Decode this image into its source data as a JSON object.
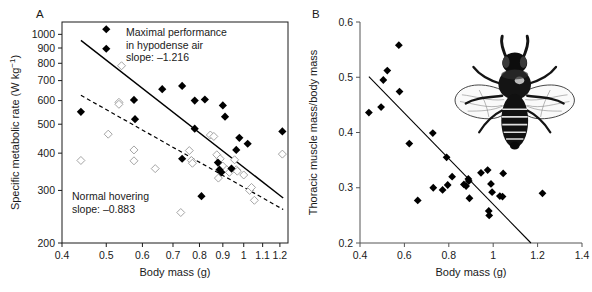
{
  "figure": {
    "panels": [
      {
        "label": "A",
        "xlabel": "Body mass (g)",
        "ylabel": "Specific metabolic rate (W kg⁻¹)",
        "annotation_top": [
          "Maximal performance",
          "in hypodense air",
          "slope: –1.216"
        ],
        "annotation_bottom": [
          "Normal hovering",
          "slope: –0.883"
        ]
      },
      {
        "label": "B",
        "xlabel": "Body mass (g)",
        "ylabel": "Thoracic muscle mass/body mass",
        "illustration": "bee-illustration"
      }
    ]
  },
  "chart_data": [
    {
      "type": "scatter",
      "panel": "A",
      "title": "",
      "xlabel": "Body mass (g)",
      "ylabel": "Specific metabolic rate (W kg-1)",
      "xscale": "log",
      "yscale": "log",
      "xlim": [
        0.4,
        1.25
      ],
      "ylim": [
        200,
        1100
      ],
      "xticks": [
        0.4,
        0.5,
        0.6,
        0.7,
        0.8,
        0.9,
        1,
        1.1,
        1.2
      ],
      "xticklabels": [
        "0.4",
        "0.5",
        "0.6",
        "0.7",
        "0.8",
        "0.9",
        "1",
        "1.1",
        "1.2"
      ],
      "yticks": [
        200,
        300,
        400,
        500,
        600,
        700,
        800,
        900,
        1000
      ],
      "yticklabels": [
        "200",
        "300",
        "400",
        "500",
        "600",
        "700",
        "800",
        "900",
        "1000"
      ],
      "grid": false,
      "legend": "none",
      "frame": "box",
      "annotations": [
        {
          "text": "Maximal performance in hypodense air slope: -1.216",
          "x": 0.72,
          "y": 980
        },
        {
          "text": "Normal hovering slope: -0.883",
          "x": 0.47,
          "y": 300
        }
      ],
      "series": [
        {
          "name": "Maximal performance in hypodense air",
          "marker": "filled-diamond",
          "slope": -1.216,
          "fit_line": {
            "x": [
              0.44,
              1.22
            ],
            "y": [
              955,
              283
            ]
          },
          "points": [
            [
              0.44,
              550
            ],
            [
              0.5,
              1040
            ],
            [
              0.5,
              895
            ],
            [
              0.575,
              603
            ],
            [
              0.578,
              520
            ],
            [
              0.663,
              655
            ],
            [
              0.733,
              672
            ],
            [
              0.733,
              383
            ],
            [
              0.781,
              600
            ],
            [
              0.781,
              483
            ],
            [
              0.808,
              287
            ],
            [
              0.822,
              605
            ],
            [
              0.878,
              372
            ],
            [
              0.885,
              352
            ],
            [
              0.893,
              345
            ],
            [
              0.9,
              578
            ],
            [
              0.91,
              530
            ],
            [
              0.94,
              355
            ],
            [
              0.963,
              410
            ],
            [
              0.978,
              450
            ],
            [
              1.02,
              430
            ],
            [
              1.215,
              473
            ]
          ]
        },
        {
          "name": "Normal hovering",
          "marker": "open-diamond",
          "slope": -0.883,
          "fit_line": {
            "x": [
              0.44,
              1.22
            ],
            "y": [
              625,
              259
            ]
          },
          "points": [
            [
              0.44,
              378
            ],
            [
              0.505,
              463
            ],
            [
              0.533,
              592
            ],
            [
              0.533,
              583
            ],
            [
              0.54,
              785
            ],
            [
              0.575,
              410
            ],
            [
              0.575,
              377
            ],
            [
              0.64,
              355
            ],
            [
              0.728,
              253
            ],
            [
              0.76,
              408
            ],
            [
              0.768,
              378
            ],
            [
              0.772,
              370
            ],
            [
              0.845,
              460
            ],
            [
              0.86,
              455
            ],
            [
              0.873,
              395
            ],
            [
              0.88,
              330
            ],
            [
              0.888,
              383
            ],
            [
              0.9,
              362
            ],
            [
              0.918,
              352
            ],
            [
              0.93,
              345
            ],
            [
              0.955,
              380
            ],
            [
              0.963,
              352
            ],
            [
              0.968,
              348
            ],
            [
              1.0,
              338
            ],
            [
              1.03,
              300
            ],
            [
              1.04,
              307
            ],
            [
              1.055,
              278
            ],
            [
              1.215,
              397
            ]
          ]
        }
      ]
    },
    {
      "type": "scatter",
      "panel": "B",
      "title": "",
      "xlabel": "Body mass (g)",
      "ylabel": "Thoracic muscle mass/body mass",
      "xscale": "linear",
      "yscale": "linear",
      "xlim": [
        0.4,
        1.4
      ],
      "ylim": [
        0.2,
        0.6
      ],
      "xticks": [
        0.4,
        0.6,
        0.8,
        1.0,
        1.2,
        1.4
      ],
      "xticklabels": [
        "0.4",
        "0.6",
        "0.8",
        "1",
        "1.2",
        "1.4"
      ],
      "yticks": [
        0.2,
        0.3,
        0.4,
        0.5,
        0.6
      ],
      "yticklabels": [
        "0.2",
        "0.3",
        "0.4",
        "0.5",
        "0.6"
      ],
      "grid": false,
      "legend": "none",
      "frame": "L-shaped",
      "series": [
        {
          "name": "Thoracic muscle mass ratio",
          "marker": "filled-diamond",
          "fit_line": {
            "x": [
              0.44,
              1.17
            ],
            "y": [
              0.501,
              0.2
            ]
          },
          "points": [
            [
              0.44,
              0.436
            ],
            [
              0.495,
              0.446
            ],
            [
              0.505,
              0.495
            ],
            [
              0.523,
              0.512
            ],
            [
              0.575,
              0.558
            ],
            [
              0.578,
              0.474
            ],
            [
              0.622,
              0.38
            ],
            [
              0.66,
              0.277
            ],
            [
              0.728,
              0.399
            ],
            [
              0.73,
              0.3
            ],
            [
              0.772,
              0.296
            ],
            [
              0.79,
              0.355
            ],
            [
              0.795,
              0.305
            ],
            [
              0.815,
              0.32
            ],
            [
              0.868,
              0.306
            ],
            [
              0.878,
              0.303
            ],
            [
              0.888,
              0.316
            ],
            [
              0.89,
              0.312
            ],
            [
              0.893,
              0.281
            ],
            [
              0.945,
              0.327
            ],
            [
              0.975,
              0.332
            ],
            [
              0.98,
              0.258
            ],
            [
              0.982,
              0.25
            ],
            [
              0.99,
              0.307
            ],
            [
              0.995,
              0.292
            ],
            [
              1.03,
              0.285
            ],
            [
              1.042,
              0.284
            ],
            [
              1.045,
              0.326
            ],
            [
              1.222,
              0.29
            ]
          ]
        }
      ]
    }
  ],
  "colors": {
    "ink": "#1a1a1a",
    "axis": "#555555",
    "marker_filled": "#000000",
    "marker_open_stroke": "#9a9a9a",
    "background": "#ffffff"
  }
}
